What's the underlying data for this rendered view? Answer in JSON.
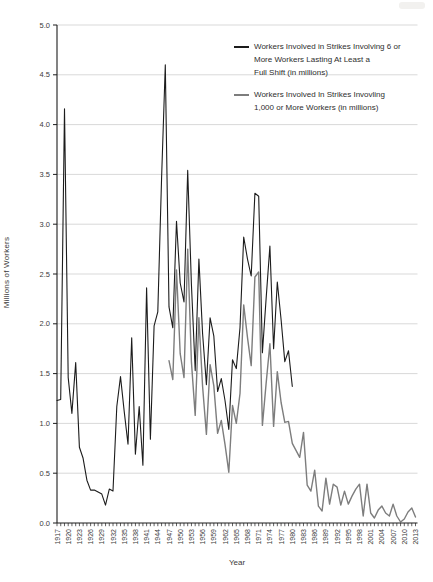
{
  "figure": {
    "background": "#ffffff",
    "axis_color": "#1c1c1c",
    "grid_color": "#c9c9c9",
    "tick_label_color": "#3a3a3a"
  },
  "legend": {
    "entries": [
      {
        "color": "#1c1c1c",
        "lines": [
          "Workers Involved in Strikes Involving 6 or",
          "More Workers Lasting At Least a",
          "Full Shift (in millions)"
        ]
      },
      {
        "color": "#7d7d7d",
        "lines": [
          "Workers Involved In Strikes Invovling",
          "1,000 or More Workers (in millions)"
        ]
      }
    ]
  },
  "chart_data": {
    "type": "line",
    "title": "",
    "xlabel": "Year",
    "ylabel": "Millions of Workers",
    "xlim": [
      1917,
      2013
    ],
    "ylim": [
      0,
      5.0
    ],
    "grid": "horizontal",
    "legend_position": "top-right",
    "y_ticks": [
      "0.0",
      "0.5",
      "1.0",
      "1.5",
      "2.0",
      "2.5",
      "3.0",
      "3.5",
      "4.0",
      "4.5",
      "5.0"
    ],
    "x_tick_labels": [
      1917,
      1920,
      1923,
      1926,
      1929,
      1932,
      1935,
      1938,
      1941,
      1944,
      1947,
      1950,
      1953,
      1956,
      1959,
      1962,
      1965,
      1968,
      1971,
      1974,
      1977,
      1980,
      1983,
      1986,
      1989,
      1992,
      1995,
      1998,
      2001,
      2004,
      2007,
      2010,
      2013
    ],
    "x_minor_tick_every": 1,
    "series": [
      {
        "name": "Workers Involved in Strikes Involving 6 or More Workers Lasting At Least a Full Shift (in millions)",
        "color": "#1c1c1c",
        "width": 1.1,
        "x": [
          1917,
          1918,
          1919,
          1920,
          1921,
          1922,
          1923,
          1924,
          1925,
          1926,
          1927,
          1928,
          1929,
          1930,
          1931,
          1932,
          1933,
          1934,
          1935,
          1936,
          1937,
          1938,
          1939,
          1940,
          1941,
          1942,
          1943,
          1944,
          1945,
          1946,
          1947,
          1948,
          1949,
          1950,
          1951,
          1952,
          1953,
          1954,
          1955,
          1956,
          1957,
          1958,
          1959,
          1960,
          1961,
          1962,
          1963,
          1964,
          1965,
          1966,
          1967,
          1968,
          1969,
          1970,
          1971,
          1972,
          1973,
          1974,
          1975,
          1976,
          1977,
          1978,
          1979,
          1980
        ],
        "values": [
          1.23,
          1.24,
          4.16,
          1.46,
          1.1,
          1.61,
          0.76,
          0.65,
          0.43,
          0.33,
          0.33,
          0.31,
          0.29,
          0.18,
          0.34,
          0.32,
          1.17,
          1.47,
          1.12,
          0.79,
          1.86,
          0.69,
          1.17,
          0.58,
          2.36,
          0.84,
          1.98,
          2.12,
          3.47,
          4.6,
          2.17,
          1.96,
          3.03,
          2.41,
          2.22,
          3.54,
          2.4,
          1.53,
          2.65,
          1.9,
          1.39,
          2.06,
          1.88,
          1.32,
          1.45,
          1.23,
          0.94,
          1.64,
          1.55,
          1.96,
          2.87,
          2.65,
          2.48,
          3.31,
          3.28,
          1.71,
          2.25,
          2.78,
          1.75,
          2.42,
          2.04,
          1.62,
          1.73,
          1.37
        ]
      },
      {
        "name": "Workers Involved In Strikes Invovling 1,000 or More Workers (in millions)",
        "color": "#7d7d7d",
        "width": 1.4,
        "x": [
          1947,
          1948,
          1949,
          1950,
          1951,
          1952,
          1953,
          1954,
          1955,
          1956,
          1957,
          1958,
          1959,
          1960,
          1961,
          1962,
          1963,
          1964,
          1965,
          1966,
          1967,
          1968,
          1969,
          1970,
          1971,
          1972,
          1973,
          1974,
          1975,
          1976,
          1977,
          1978,
          1979,
          1980,
          1981,
          1982,
          1983,
          1984,
          1985,
          1986,
          1987,
          1988,
          1989,
          1990,
          1991,
          1992,
          1993,
          1994,
          1995,
          1996,
          1997,
          1998,
          1999,
          2000,
          2001,
          2002,
          2003,
          2004,
          2005,
          2006,
          2007,
          2008,
          2009,
          2010,
          2011,
          2012,
          2013
        ],
        "values": [
          1.63,
          1.44,
          2.54,
          1.7,
          1.46,
          2.75,
          1.62,
          1.08,
          2.06,
          1.37,
          0.89,
          1.59,
          1.38,
          0.9,
          1.03,
          0.79,
          0.51,
          1.18,
          1.0,
          1.3,
          2.19,
          1.86,
          1.58,
          2.47,
          2.52,
          0.98,
          1.4,
          1.8,
          0.97,
          1.52,
          1.21,
          1.01,
          1.02,
          0.8,
          0.73,
          0.66,
          0.91,
          0.38,
          0.32,
          0.53,
          0.17,
          0.12,
          0.45,
          0.19,
          0.39,
          0.36,
          0.18,
          0.32,
          0.19,
          0.27,
          0.34,
          0.39,
          0.07,
          0.39,
          0.1,
          0.05,
          0.13,
          0.17,
          0.1,
          0.07,
          0.19,
          0.07,
          0.01,
          0.04,
          0.11,
          0.15,
          0.06
        ]
      }
    ]
  }
}
